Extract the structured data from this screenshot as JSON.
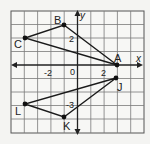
{
  "diagram": {
    "type": "coordinate-plane",
    "grid": {
      "cols": 10,
      "rows": 9,
      "x_min": -5,
      "x_max": 5,
      "y_min": -5,
      "y_max": 4,
      "color": "#7a7a7a"
    },
    "axes": {
      "x_label": "x",
      "y_label": "y",
      "color": "#222222"
    },
    "tick_labels": {
      "x_neg2": "-2",
      "origin": "0",
      "x_pos2": "2",
      "y_pos2": "2",
      "y_neg3": "-3"
    },
    "triangles": [
      {
        "name": "ABC",
        "vertices": [
          {
            "label": "A",
            "x": 3,
            "y": 0
          },
          {
            "label": "B",
            "x": -1,
            "y": 3
          },
          {
            "label": "C",
            "x": -4,
            "y": 2
          }
        ]
      },
      {
        "name": "JKL",
        "vertices": [
          {
            "label": "J",
            "x": 3,
            "y": -1
          },
          {
            "label": "K",
            "x": -1,
            "y": -4
          },
          {
            "label": "L",
            "x": -4,
            "y": -3
          }
        ]
      }
    ],
    "labels": {
      "A": "A",
      "B": "B",
      "C": "C",
      "J": "J",
      "K": "K",
      "L": "L"
    },
    "line_color": "#1a1a1a"
  }
}
